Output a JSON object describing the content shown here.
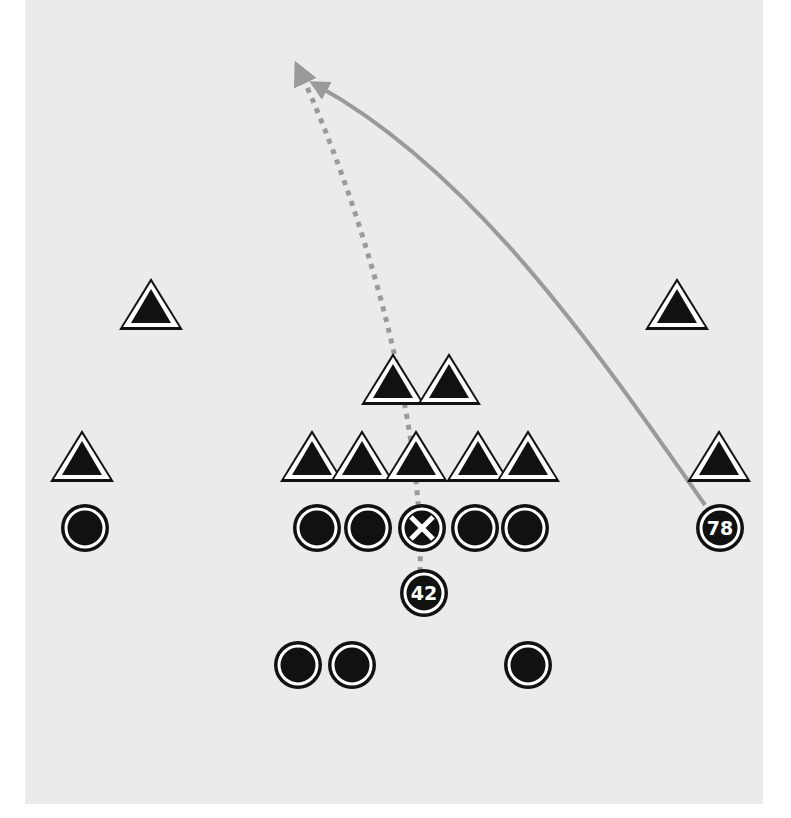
{
  "diagram": {
    "colors": {
      "field": "#ebebeb",
      "player_fill": "#111111",
      "player_ring": "#ffffff",
      "route": "#9a9a9a"
    },
    "defense": [
      {
        "id": "d1",
        "x": 151,
        "y": 307
      },
      {
        "id": "d2",
        "x": 677,
        "y": 307
      },
      {
        "id": "d3",
        "x": 393,
        "y": 382
      },
      {
        "id": "d4",
        "x": 449,
        "y": 382
      },
      {
        "id": "d5",
        "x": 82,
        "y": 459
      },
      {
        "id": "d6",
        "x": 312,
        "y": 459
      },
      {
        "id": "d7",
        "x": 362,
        "y": 459
      },
      {
        "id": "d8",
        "x": 416,
        "y": 459
      },
      {
        "id": "d9",
        "x": 478,
        "y": 459
      },
      {
        "id": "d10",
        "x": 528,
        "y": 459
      },
      {
        "id": "d11",
        "x": 719,
        "y": 459
      }
    ],
    "offense": [
      {
        "id": "o1",
        "x": 85,
        "y": 528,
        "label": ""
      },
      {
        "id": "o2",
        "x": 317,
        "y": 528,
        "label": ""
      },
      {
        "id": "o3",
        "x": 368,
        "y": 528,
        "label": ""
      },
      {
        "id": "center",
        "x": 422,
        "y": 528,
        "label": "X",
        "type": "center"
      },
      {
        "id": "o5",
        "x": 475,
        "y": 528,
        "label": ""
      },
      {
        "id": "o6",
        "x": 525,
        "y": 528,
        "label": ""
      },
      {
        "id": "receiver78",
        "x": 720,
        "y": 528,
        "label": "78"
      },
      {
        "id": "back42",
        "x": 424,
        "y": 593,
        "label": "42"
      },
      {
        "id": "o9",
        "x": 298,
        "y": 665,
        "label": ""
      },
      {
        "id": "o10",
        "x": 352,
        "y": 665,
        "label": ""
      },
      {
        "id": "o11",
        "x": 528,
        "y": 665,
        "label": ""
      }
    ],
    "routes": [
      {
        "id": "route-42",
        "style": "dashed",
        "from": "42",
        "path": "M420 572 C 425 420, 360 200, 300 72"
      },
      {
        "id": "route-78",
        "style": "solid",
        "from": "78",
        "path": "M705 505 C 590 340, 470 170, 318 86"
      }
    ]
  }
}
